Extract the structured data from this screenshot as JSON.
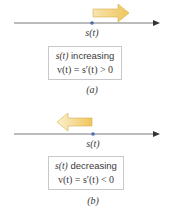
{
  "panels": [
    {
      "id": "a",
      "position_label": "s(t)",
      "box_line1_fn": "s(t)",
      "box_line1_text": "increasing",
      "box_line2": "v(t) = s′(t) > 0",
      "caption": "(a)",
      "arrow_direction": "right"
    },
    {
      "id": "b",
      "position_label": "s(t)",
      "box_line1_fn": "s(t)",
      "box_line1_text": "decreasing",
      "box_line2": "v(t) = s′(t) < 0",
      "caption": "(b)",
      "arrow_direction": "left"
    }
  ],
  "colors": {
    "axis": "#555555",
    "point": "#4a6fb5",
    "arrow_fill_start": "#f7e2a6",
    "arrow_fill_end": "#f0c860",
    "arrow_stroke": "#d9b04a",
    "box_border": "#c8c8c8"
  }
}
